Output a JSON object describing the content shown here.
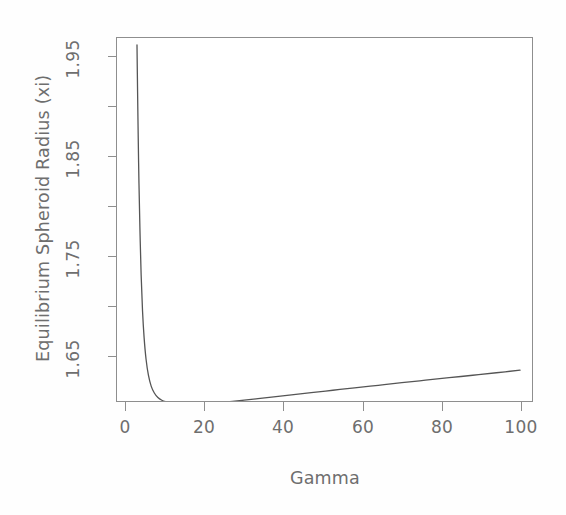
{
  "chart_data": {
    "type": "line",
    "title": "",
    "xlabel": "Gamma",
    "ylabel": "Equilibrium Spheroid Radius (xi)",
    "xlim": [
      -2,
      105
    ],
    "ylim": [
      1.595,
      1.968
    ],
    "xticks": [
      0,
      20,
      40,
      60,
      80,
      100
    ],
    "xticklabels": [
      "0",
      "20",
      "40",
      "60",
      "80",
      "100"
    ],
    "yticks": [
      1.65,
      1.7,
      1.75,
      1.8,
      1.85,
      1.9,
      1.95
    ],
    "yticklabels": [
      "1.65",
      "",
      "1.75",
      "",
      "1.85",
      "",
      "1.95"
    ],
    "ylabeled_ticks": [
      {
        "value": 1.65,
        "label": "1.65"
      },
      {
        "value": 1.75,
        "label": "1.75"
      },
      {
        "value": 1.85,
        "label": "1.85"
      },
      {
        "value": 1.95,
        "label": "1.95"
      }
    ],
    "grid": false,
    "legend": null,
    "line_color": "#555555",
    "background_color": "#ffffff",
    "frame_color": "#8e8e8e",
    "series": [
      {
        "name": "Equilibrium Spheroid Radius",
        "x": [
          2.8,
          2.95,
          3.1,
          3.3,
          3.55,
          3.85,
          4.2,
          4.6,
          5.1,
          5.7,
          6.4,
          7.2,
          8.1,
          9.1,
          10.2,
          11.4,
          12.7,
          14.1,
          15.6,
          17.2,
          18.9,
          20.7,
          22.6,
          24.6,
          27.0,
          30.0,
          33.5,
          37.5,
          42.0,
          47.0,
          52.5,
          58.0,
          64.0,
          70.0,
          76.0,
          82.0,
          88.0,
          94.0,
          100.0
        ],
        "y": [
          1.962,
          1.915,
          1.872,
          1.823,
          1.776,
          1.731,
          1.695,
          1.668,
          1.646,
          1.63,
          1.619,
          1.612,
          1.6075,
          1.6048,
          1.6032,
          1.6022,
          1.6016,
          1.6013,
          1.6012,
          1.6012,
          1.6013,
          1.6016,
          1.6021,
          1.6027,
          1.6036,
          1.6048,
          1.6063,
          1.6081,
          1.6101,
          1.6124,
          1.6148,
          1.6172,
          1.6198,
          1.6224,
          1.6249,
          1.6274,
          1.6299,
          1.6324,
          1.635
        ]
      }
    ]
  },
  "axes": {
    "x_title": "Gamma",
    "y_title": "Equilibrium Spheroid Radius (xi)",
    "x_tick_labels": [
      "0",
      "20",
      "40",
      "60",
      "80",
      "100"
    ],
    "y_tick_labels": [
      "1.95",
      "1.85",
      "1.75",
      "1.65"
    ]
  }
}
